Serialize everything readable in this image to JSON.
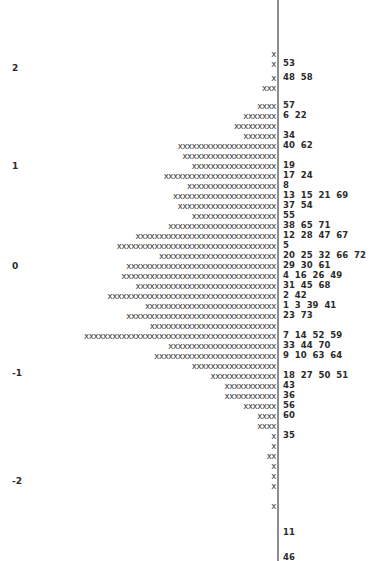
{
  "figure": {
    "type": "stem-and-leaf",
    "axis_line_color": "#8d8d8d",
    "mark_color": "#3a3a3a",
    "text_color": "#2b2b2b",
    "background": "#ffffff",
    "mark_character": "x"
  },
  "y_axis": {
    "ticks": [
      {
        "label": "2",
        "y": 63
      },
      {
        "label": "1",
        "y": 161
      },
      {
        "label": "0",
        "y": 261
      },
      {
        "label": "-1",
        "y": 368
      },
      {
        "label": "-2",
        "y": 476
      }
    ]
  },
  "chart_data": {
    "type": "bar",
    "title": "",
    "xlabel": "",
    "ylabel": "",
    "orientation": "horizontal-right-to-left",
    "grid": false,
    "legend": null,
    "ylim": [
      -2.6,
      2.6
    ],
    "categories": [
      "r0",
      "r1",
      "r2",
      "r3",
      "r4",
      "r5",
      "r6",
      "r7",
      "r8",
      "r9",
      "r10",
      "r11",
      "r12",
      "r13",
      "r14",
      "r15",
      "r16",
      "r17",
      "r18",
      "r19",
      "r20",
      "r21",
      "r22",
      "r23",
      "r24",
      "r25",
      "r26",
      "r27",
      "r28",
      "r29",
      "r30",
      "r31",
      "r32",
      "r33",
      "r34",
      "r35",
      "r36",
      "r37",
      "r38",
      "r39",
      "r40",
      "r41",
      "r42",
      "r43",
      "r44",
      "r45",
      "r46",
      "r47",
      "r48"
    ],
    "values": [
      1,
      1,
      1,
      3,
      4,
      7,
      9,
      7,
      21,
      20,
      18,
      24,
      19,
      22,
      21,
      18,
      23,
      30,
      34,
      25,
      32,
      33,
      30,
      36,
      28,
      32,
      27,
      41,
      23,
      26,
      18,
      14,
      14,
      11,
      11,
      10,
      9,
      5,
      3,
      3,
      1,
      1,
      2,
      1,
      1,
      1,
      1,
      0,
      0
    ],
    "rows": [
      {
        "y": 49,
        "count": 1,
        "marks": "x",
        "leaves": ""
      },
      {
        "y": 59,
        "count": 1,
        "marks": "x",
        "leaves": "53"
      },
      {
        "y": 73,
        "count": 1,
        "marks": "x",
        "leaves": "48  58"
      },
      {
        "y": 83,
        "count": 3,
        "marks": "xxx",
        "leaves": ""
      },
      {
        "y": 101,
        "count": 4,
        "marks": "xxxx",
        "leaves": "57"
      },
      {
        "y": 111,
        "count": 7,
        "marks": "xxxxxxx",
        "leaves": "6  22"
      },
      {
        "y": 121,
        "count": 9,
        "marks": "xxxxxxxxx",
        "leaves": ""
      },
      {
        "y": 131,
        "count": 7,
        "marks": "xxxxxxx",
        "leaves": "34"
      },
      {
        "y": 141,
        "count": 21,
        "marks": "xxxxxxxxxxxxxxxxxxxxx",
        "leaves": "40  62"
      },
      {
        "y": 151,
        "count": 20,
        "marks": "xxxxxxxxxxxxxxxxxxxx",
        "leaves": ""
      },
      {
        "y": 161,
        "count": 18,
        "marks": "xxxxxxxxxxxxxxxxxx",
        "leaves": "19"
      },
      {
        "y": 171,
        "count": 24,
        "marks": "xxxxxxxxxxxxxxxxxxxxxxxx",
        "leaves": "17  24"
      },
      {
        "y": 181,
        "count": 19,
        "marks": "xxxxxxxxxxxxxxxxxxx",
        "leaves": "8"
      },
      {
        "y": 191,
        "count": 22,
        "marks": "xxxxxxxxxxxxxxxxxxxxxx",
        "leaves": "13  15  21  69"
      },
      {
        "y": 201,
        "count": 21,
        "marks": "xxxxxxxxxxxxxxxxxxxxx",
        "leaves": "37  54"
      },
      {
        "y": 211,
        "count": 18,
        "marks": "xxxxxxxxxxxxxxxxxx",
        "leaves": "55"
      },
      {
        "y": 221,
        "count": 23,
        "marks": "xxxxxxxxxxxxxxxxxxxxxxx",
        "leaves": "38  65  71"
      },
      {
        "y": 231,
        "count": 30,
        "marks": "xxxxxxxxxxxxxxxxxxxxxxxxxxxxxx",
        "leaves": "12  28  47  67"
      },
      {
        "y": 241,
        "count": 34,
        "marks": "xxxxxxxxxxxxxxxxxxxxxxxxxxxxxxxxxx",
        "leaves": "5"
      },
      {
        "y": 251,
        "count": 25,
        "marks": "xxxxxxxxxxxxxxxxxxxxxxxxx",
        "leaves": "20  25  32  66  72"
      },
      {
        "y": 261,
        "count": 32,
        "marks": "xxxxxxxxxxxxxxxxxxxxxxxxxxxxxxxx",
        "leaves": "29  30  61"
      },
      {
        "y": 271,
        "count": 33,
        "marks": "xxxxxxxxxxxxxxxxxxxxxxxxxxxxxxxxx",
        "leaves": "4  16  26  49"
      },
      {
        "y": 281,
        "count": 30,
        "marks": "xxxxxxxxxxxxxxxxxxxxxxxxxxxxxx",
        "leaves": "31  45  68"
      },
      {
        "y": 291,
        "count": 36,
        "marks": "xxxxxxxxxxxxxxxxxxxxxxxxxxxxxxxxxxxx",
        "leaves": "2  42"
      },
      {
        "y": 301,
        "count": 28,
        "marks": "xxxxxxxxxxxxxxxxxxxxxxxxxxxx",
        "leaves": "1  3  39  41"
      },
      {
        "y": 311,
        "count": 32,
        "marks": "xxxxxxxxxxxxxxxxxxxxxxxxxxxxxxxx",
        "leaves": "23  73"
      },
      {
        "y": 321,
        "count": 27,
        "marks": "xxxxxxxxxxxxxxxxxxxxxxxxxxx",
        "leaves": ""
      },
      {
        "y": 331,
        "count": 41,
        "marks": "xxxxxxxxxxxxxxxxxxxxxxxxxxxxxxxxxxxxxxxxx",
        "leaves": "7  14  52  59"
      },
      {
        "y": 341,
        "count": 23,
        "marks": "xxxxxxxxxxxxxxxxxxxxxxx",
        "leaves": "33  44  70"
      },
      {
        "y": 351,
        "count": 26,
        "marks": "xxxxxxxxxxxxxxxxxxxxxxxxxx",
        "leaves": "9  10  63  64"
      },
      {
        "y": 361,
        "count": 18,
        "marks": "xxxxxxxxxxxxxxxxxx",
        "leaves": ""
      },
      {
        "y": 371,
        "count": 14,
        "marks": "xxxxxxxxxxxxxx",
        "leaves": "18  27  50  51"
      },
      {
        "y": 381,
        "count": 11,
        "marks": "xxxxxxxxxxx",
        "leaves": "43"
      },
      {
        "y": 391,
        "count": 11,
        "marks": "xxxxxxxxxxx",
        "leaves": "36"
      },
      {
        "y": 401,
        "count": 7,
        "marks": "xxxxxxx",
        "leaves": "56"
      },
      {
        "y": 411,
        "count": 4,
        "marks": "xxxx",
        "leaves": "60"
      },
      {
        "y": 421,
        "count": 4,
        "marks": "xxxx",
        "leaves": ""
      },
      {
        "y": 431,
        "count": 1,
        "marks": "x",
        "leaves": "35"
      },
      {
        "y": 441,
        "count": 1,
        "marks": "x",
        "leaves": ""
      },
      {
        "y": 451,
        "count": 2,
        "marks": "xx",
        "leaves": ""
      },
      {
        "y": 461,
        "count": 1,
        "marks": "x",
        "leaves": ""
      },
      {
        "y": 471,
        "count": 1,
        "marks": "x",
        "leaves": ""
      },
      {
        "y": 481,
        "count": 1,
        "marks": "x",
        "leaves": ""
      },
      {
        "y": 501,
        "count": 1,
        "marks": "x",
        "leaves": ""
      },
      {
        "y": 528,
        "count": 0,
        "marks": "",
        "leaves": "11"
      },
      {
        "y": 553,
        "count": 0,
        "marks": "",
        "leaves": "46"
      }
    ]
  }
}
